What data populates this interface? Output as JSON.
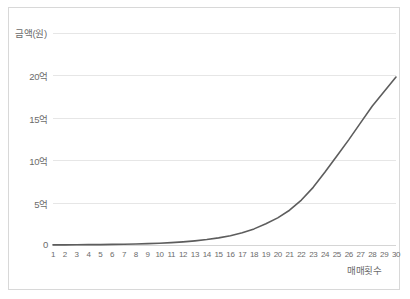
{
  "chart_data": {
    "type": "line",
    "title": "",
    "xlabel": "매매횟수",
    "ylabel": "금액(원)",
    "xlim": [
      1,
      30
    ],
    "ylim": [
      0,
      25
    ],
    "grid": true,
    "legend_position": "none",
    "series_color": "#5d5d5d",
    "grid_color": "#e6e6e6",
    "axis_text_color": "#6b6b6b",
    "y_tick_labels": [
      "20억",
      "15억",
      "10억",
      "5억",
      "0"
    ],
    "y_tick_values": [
      20,
      15,
      10,
      5,
      0
    ],
    "x_tick_labels": [
      "1",
      "2",
      "3",
      "4",
      "5",
      "6",
      "7",
      "8",
      "9",
      "10",
      "11",
      "12",
      "13",
      "14",
      "15",
      "16",
      "17",
      "18",
      "19",
      "20",
      "21",
      "22",
      "23",
      "24",
      "25",
      "26",
      "27",
      "28",
      "29",
      "30"
    ],
    "x": [
      1,
      2,
      3,
      4,
      5,
      6,
      7,
      8,
      9,
      10,
      11,
      12,
      13,
      14,
      15,
      16,
      17,
      18,
      19,
      20,
      21,
      22,
      23,
      24,
      25,
      26,
      27,
      28,
      29,
      30
    ],
    "values": [
      0.01,
      0.02,
      0.03,
      0.04,
      0.05,
      0.07,
      0.09,
      0.12,
      0.16,
      0.21,
      0.28,
      0.37,
      0.49,
      0.64,
      0.84,
      1.1,
      1.45,
      1.9,
      2.5,
      3.2,
      4.1,
      5.3,
      6.8,
      8.6,
      10.5,
      12.4,
      14.4,
      16.4,
      18.1,
      19.8
    ],
    "series_name": "금액(원)",
    "unit_note": "억"
  },
  "yaxis": {
    "title": "금액(원)",
    "ticks": [
      {
        "label": "20억",
        "value": 20
      },
      {
        "label": "15억",
        "value": 15
      },
      {
        "label": "10억",
        "value": 10
      },
      {
        "label": "5억",
        "value": 5
      },
      {
        "label": "0",
        "value": 0
      }
    ]
  },
  "xaxis": {
    "title": "매매횟수",
    "ticks": [
      "1",
      "2",
      "3",
      "4",
      "5",
      "6",
      "7",
      "8",
      "9",
      "10",
      "11",
      "12",
      "13",
      "14",
      "15",
      "16",
      "17",
      "18",
      "19",
      "20",
      "21",
      "22",
      "23",
      "24",
      "25",
      "26",
      "27",
      "28",
      "29",
      "30"
    ]
  }
}
